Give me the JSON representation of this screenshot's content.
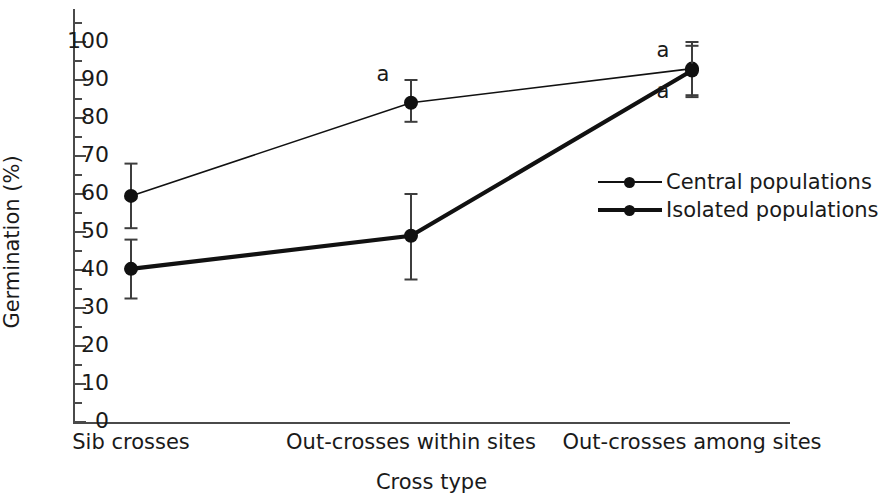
{
  "chart_data": {
    "type": "line",
    "title": "",
    "xlabel": "Cross type",
    "ylabel": "Germination (%)",
    "categories": [
      "Sib crosses",
      "Out-crosses within sites",
      "Out-crosses among sites"
    ],
    "ylim": [
      0,
      105
    ],
    "ytick_major": [
      0,
      10,
      20,
      30,
      40,
      50,
      60,
      70,
      80,
      90,
      100
    ],
    "ytick_minor": [
      5,
      15,
      25,
      35,
      45,
      55,
      65,
      75,
      85,
      95,
      105
    ],
    "ytick_labels": [
      "0",
      "10",
      "20",
      "30",
      "40",
      "50",
      "60",
      "70",
      "80",
      "90",
      "100"
    ],
    "grid": false,
    "legend_position": "center-right",
    "series": [
      {
        "name": "Central populations",
        "line_style": "thin",
        "color": "#111111",
        "values": [
          59.5,
          84,
          93
        ],
        "err_low": [
          51,
          79,
          86
        ],
        "err_high": [
          68,
          90,
          100
        ]
      },
      {
        "name": "Isolated populations",
        "line_style": "thick",
        "color": "#111111",
        "values": [
          40.3,
          49,
          92.5
        ],
        "err_low": [
          32.5,
          37.5,
          85.5
        ],
        "err_high": [
          48,
          60,
          99
        ]
      }
    ],
    "annotations": [
      {
        "text": "a",
        "x_index": 1,
        "series": "Central populations",
        "value": 90,
        "dx": -28,
        "dy": -6
      },
      {
        "text": "a",
        "x_index": 2,
        "series": "Central populations",
        "value": 98,
        "dx": -29,
        "dy": 0
      },
      {
        "text": "a",
        "x_index": 2,
        "series": "Isolated populations",
        "value": 87,
        "dx": -29,
        "dy": 0
      }
    ]
  },
  "legend": {
    "items": [
      {
        "label": "Central populations"
      },
      {
        "label": "Isolated populations"
      }
    ]
  }
}
